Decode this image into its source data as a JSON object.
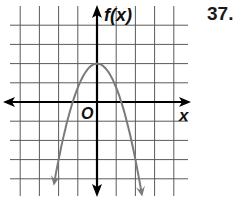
{
  "problem": {
    "number": "37."
  },
  "chart_data": {
    "type": "line",
    "title": "",
    "xlabel": "x",
    "ylabel": "f(x)",
    "origin_label": "O",
    "grid": true,
    "xlim": [
      -4.8,
      4.9
    ],
    "ylim": [
      -4.9,
      5.0
    ],
    "grid_spacing": 1,
    "series": [
      {
        "name": "f(x)",
        "function": "f(x) = -1.25x^2 + 2",
        "vertex": [
          0,
          2
        ],
        "x_intercepts": [
          -1.27,
          1.27
        ],
        "end_arrows": [
          [
            -2.2,
            -4.8
          ],
          [
            2.3,
            -4.8
          ]
        ],
        "x": [
          -2.2,
          -2,
          -1.5,
          -1,
          -0.5,
          0,
          0.5,
          1,
          1.5,
          2,
          2.3
        ],
        "y": [
          -4.05,
          -3.0,
          -0.81,
          0.75,
          1.69,
          2.0,
          1.69,
          0.75,
          -0.81,
          -3.0,
          -4.61
        ],
        "color": "#7a7a7a"
      }
    ],
    "axis_color": "#000000",
    "grid_color": "#555555"
  }
}
